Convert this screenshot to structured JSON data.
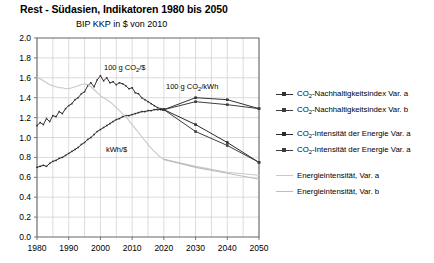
{
  "header": {
    "title": "Rest - Südasien, Indikatoren 1980 bis 2050",
    "subtitle": "BIP KKP in $ von 2010"
  },
  "colors": {
    "dark": "#333333",
    "mid": "#4d4d4d",
    "light_gray": "#c8c8c8",
    "gray": "#b0b0b0",
    "grid": "#cccccc",
    "axis": "#555555"
  },
  "annotations": [
    {
      "id": "annot-co2-per-dollar",
      "text_main": "100 g CO",
      "sub": "2",
      "text_tail": "/$",
      "x": 104,
      "y": 70
    },
    {
      "id": "annot-co2-per-kwh",
      "text_main": "100 g CO",
      "sub": "2",
      "text_tail": "/kWh",
      "x": 166,
      "y": 89
    },
    {
      "id": "annot-kwh-per-dollar",
      "text_main": "kWh/$",
      "sub": "",
      "text_tail": "",
      "x": 106,
      "y": 152
    }
  ],
  "legend": {
    "items": [
      {
        "id": "legend-co2-index-a",
        "label_main": "CO",
        "sub": "2",
        "label_tail": "-Nachhaltigkeitsindex Var. a",
        "marker": "square",
        "color": "#333333",
        "top": 88
      },
      {
        "id": "legend-co2-index-b",
        "label_main": "CO",
        "sub": "2",
        "label_tail": "-Nachhaltigkeitsindex Var. b",
        "marker": "square",
        "color": "#3d3d3d",
        "top": 104
      },
      {
        "id": "legend-co2-intensity-a",
        "label_main": "CO",
        "sub": "2",
        "label_tail": "-Intensität der Energie Var. a",
        "marker": "square",
        "color": "#2b2b2b",
        "top": 128
      },
      {
        "id": "legend-co2-intensity-b",
        "label_main": "CO",
        "sub": "2",
        "label_tail": "-Intensität der Energie Var. a",
        "marker": "square",
        "color": "#3d3d3d",
        "top": 144
      },
      {
        "id": "legend-energy-intensity-a",
        "label_main": "Energieintensität, Var. a",
        "sub": "",
        "label_tail": "",
        "marker": "line",
        "color": "#c8c8c8",
        "top": 169
      },
      {
        "id": "legend-energy-intensity-b",
        "label_main": "Energieintensität, Var. b",
        "sub": "",
        "label_tail": "",
        "marker": "line",
        "color": "#bdbdbd",
        "top": 185
      }
    ]
  },
  "chart_data": {
    "type": "line",
    "title": "Rest - Südasien, Indikatoren 1980 bis 2050",
    "subtitle": "BIP KKP in $ von 2010",
    "xlabel": "",
    "ylabel": "",
    "xlim": [
      1980,
      2050
    ],
    "ylim": [
      0.0,
      2.0
    ],
    "ytick_step": 0.2,
    "grid": true,
    "legend_position": "right",
    "xticks": [
      1980,
      1990,
      2000,
      2010,
      2020,
      2030,
      2040,
      2050
    ],
    "xticks_minor_step": 5,
    "yticks": [
      "2.0",
      "1.8",
      "1.6",
      "1.4",
      "1.2",
      "1.0",
      "0.8",
      "0.6",
      "0.4",
      "0.2",
      "0.0"
    ],
    "series": [
      {
        "name": "CO2-Nachhaltigkeitsindex Var. a",
        "color": "#333333",
        "marker": "square",
        "x": [
          1980,
          1981,
          1982,
          1983,
          1984,
          1985,
          1986,
          1987,
          1988,
          1989,
          1990,
          1991,
          1992,
          1993,
          1994,
          1995,
          1996,
          1997,
          1998,
          1999,
          2000,
          2001,
          2002,
          2003,
          2004,
          2005,
          2006,
          2007,
          2008,
          2009,
          2010,
          2011,
          2012,
          2013,
          2014,
          2015,
          2016,
          2017,
          2018,
          2019,
          2020,
          2030,
          2040,
          2050
        ],
        "values": [
          1.12,
          1.15,
          1.13,
          1.19,
          1.16,
          1.22,
          1.21,
          1.26,
          1.24,
          1.29,
          1.32,
          1.34,
          1.38,
          1.4,
          1.44,
          1.46,
          1.52,
          1.55,
          1.51,
          1.58,
          1.62,
          1.57,
          1.6,
          1.55,
          1.56,
          1.53,
          1.55,
          1.54,
          1.52,
          1.49,
          1.5,
          1.45,
          1.44,
          1.4,
          1.38,
          1.36,
          1.34,
          1.32,
          1.3,
          1.29,
          1.28,
          1.4,
          1.38,
          1.29
        ]
      },
      {
        "name": "CO2-Nachhaltigkeitsindex Var. b",
        "color": "#3d3d3d",
        "marker": "square",
        "x": [
          2020,
          2030,
          2040,
          2050
        ],
        "values": [
          1.28,
          1.36,
          1.33,
          1.29
        ]
      },
      {
        "name": "CO2-Intensität der Energie Var. a",
        "color": "#2b2b2b",
        "marker": "square",
        "x": [
          1980,
          1981,
          1982,
          1983,
          1984,
          1985,
          1986,
          1987,
          1988,
          1989,
          1990,
          1991,
          1992,
          1993,
          1994,
          1995,
          1996,
          1997,
          1998,
          1999,
          2000,
          2001,
          2002,
          2003,
          2004,
          2005,
          2006,
          2007,
          2008,
          2009,
          2010,
          2011,
          2012,
          2013,
          2014,
          2015,
          2016,
          2017,
          2018,
          2019,
          2020,
          2030,
          2040,
          2050
        ],
        "values": [
          0.7,
          0.71,
          0.72,
          0.71,
          0.74,
          0.76,
          0.77,
          0.79,
          0.8,
          0.82,
          0.84,
          0.86,
          0.88,
          0.9,
          0.93,
          0.95,
          0.98,
          1.0,
          1.03,
          1.06,
          1.08,
          1.1,
          1.12,
          1.14,
          1.16,
          1.18,
          1.19,
          1.21,
          1.22,
          1.22,
          1.23,
          1.24,
          1.25,
          1.26,
          1.26,
          1.27,
          1.27,
          1.28,
          1.28,
          1.28,
          1.28,
          1.13,
          0.95,
          0.75
        ]
      },
      {
        "name": "CO2-Intensität der Energie Var. b",
        "color": "#3d3d3d",
        "marker": "square",
        "x": [
          2020,
          2030,
          2040,
          2050
        ],
        "values": [
          1.28,
          1.06,
          0.92,
          0.75
        ]
      },
      {
        "name": "Energieintensität, Var. a",
        "color": "#c8c8c8",
        "marker": "none",
        "x": [
          1980,
          1981,
          1982,
          1983,
          1984,
          1985,
          1986,
          1987,
          1988,
          1989,
          1990,
          1991,
          1992,
          1993,
          1994,
          1995,
          1996,
          1997,
          1998,
          1999,
          2000,
          2001,
          2002,
          2003,
          2004,
          2005,
          2006,
          2007,
          2008,
          2009,
          2010,
          2011,
          2012,
          2013,
          2014,
          2015,
          2016,
          2017,
          2018,
          2019,
          2020,
          2030,
          2040,
          2050
        ],
        "values": [
          1.6,
          1.59,
          1.57,
          1.55,
          1.53,
          1.52,
          1.51,
          1.5,
          1.5,
          1.49,
          1.49,
          1.5,
          1.51,
          1.52,
          1.53,
          1.54,
          1.53,
          1.51,
          1.48,
          1.45,
          1.42,
          1.4,
          1.38,
          1.36,
          1.33,
          1.3,
          1.27,
          1.24,
          1.21,
          1.17,
          1.13,
          1.09,
          1.05,
          1.01,
          0.97,
          0.93,
          0.89,
          0.86,
          0.83,
          0.8,
          0.78,
          0.71,
          0.65,
          0.62
        ]
      },
      {
        "name": "Energieintensität, Var. b",
        "color": "#bdbdbd",
        "marker": "none",
        "x": [
          2020,
          2030,
          2040,
          2050
        ],
        "values": [
          0.78,
          0.7,
          0.64,
          0.58
        ]
      }
    ]
  }
}
